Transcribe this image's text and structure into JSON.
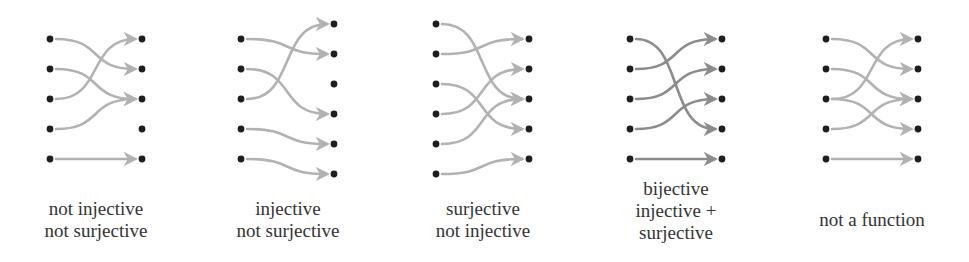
{
  "colors": {
    "dot": "#1e1e1e",
    "arrow_light": "#b2b2b2",
    "arrow_dark": "#8c8c8c",
    "text": "#333333",
    "background": "#ffffff"
  },
  "diagrams": [
    {
      "id": "not-injective-not-surjective",
      "caption": [
        "not injective",
        "not surjective"
      ],
      "left_x": 50,
      "right_x": 142,
      "left_y": [
        39,
        69,
        99,
        129,
        159
      ],
      "right_y": [
        39,
        69,
        99,
        129,
        159
      ],
      "arrow_color": "light",
      "mappings": [
        [
          0,
          1
        ],
        [
          1,
          2
        ],
        [
          2,
          0
        ],
        [
          3,
          2
        ],
        [
          4,
          4
        ]
      ],
      "caption_center_x": 96,
      "caption_top": 198
    },
    {
      "id": "injective-not-surjective",
      "caption": [
        "injective",
        "not surjective"
      ],
      "left_x": 241,
      "right_x": 334,
      "left_y": [
        39,
        69,
        99,
        129,
        159
      ],
      "right_y": [
        24,
        54,
        84,
        114,
        144,
        174
      ],
      "arrow_color": "light",
      "mappings": [
        [
          0,
          1
        ],
        [
          1,
          3
        ],
        [
          2,
          0
        ],
        [
          3,
          4
        ],
        [
          4,
          5
        ]
      ],
      "caption_center_x": 288,
      "caption_top": 198
    },
    {
      "id": "surjective-not-injective",
      "caption": [
        "surjective",
        "not injective"
      ],
      "left_x": 436,
      "right_x": 529,
      "left_y": [
        24,
        54,
        84,
        114,
        144,
        174
      ],
      "right_y": [
        39,
        69,
        99,
        129,
        159
      ],
      "arrow_color": "light",
      "mappings": [
        [
          0,
          2
        ],
        [
          1,
          0
        ],
        [
          2,
          3
        ],
        [
          3,
          1
        ],
        [
          4,
          2
        ],
        [
          5,
          4
        ]
      ],
      "caption_center_x": 483,
      "caption_top": 198
    },
    {
      "id": "bijective",
      "caption": [
        "bijective",
        "injective +",
        "surjective"
      ],
      "left_x": 630,
      "right_x": 722,
      "left_y": [
        39,
        69,
        99,
        129,
        159
      ],
      "right_y": [
        39,
        69,
        99,
        129,
        159
      ],
      "arrow_color": "dark",
      "mappings": [
        [
          0,
          3
        ],
        [
          1,
          0
        ],
        [
          2,
          1
        ],
        [
          3,
          2
        ],
        [
          4,
          4
        ]
      ],
      "caption_center_x": 676,
      "caption_top": 178
    },
    {
      "id": "not-a-function",
      "caption": [
        "not a function"
      ],
      "left_x": 826,
      "right_x": 918,
      "left_y": [
        39,
        69,
        99,
        129,
        159
      ],
      "right_y": [
        39,
        69,
        99,
        129,
        159
      ],
      "arrow_color": "light",
      "mappings": [
        [
          0,
          1
        ],
        [
          1,
          2
        ],
        [
          2,
          0
        ],
        [
          2,
          3
        ],
        [
          3,
          2
        ],
        [
          4,
          4
        ]
      ],
      "caption_center_x": 872,
      "caption_top": 209
    }
  ]
}
